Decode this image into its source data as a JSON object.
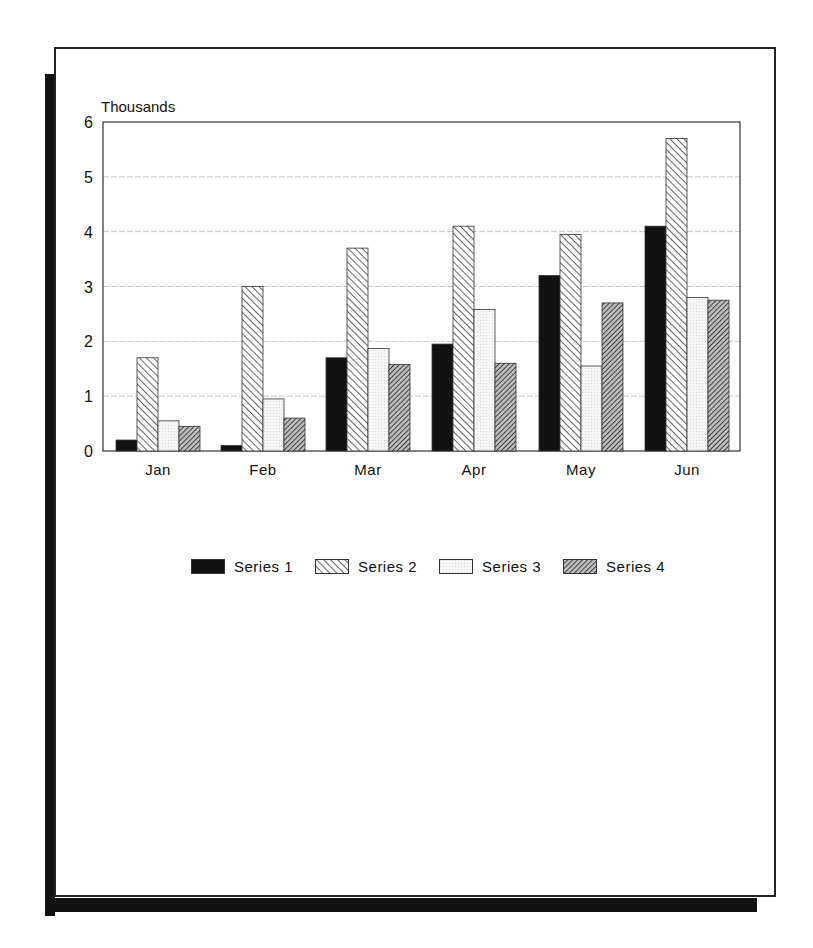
{
  "chart_data": {
    "type": "bar",
    "title": "",
    "ylabel": "Thousands",
    "xlabel": "",
    "ylim": [
      0,
      6
    ],
    "yticks": [
      0,
      1,
      2,
      3,
      4,
      5,
      6
    ],
    "grid": true,
    "legend_position": "bottom",
    "categories": [
      "Jan",
      "Feb",
      "Mar",
      "Apr",
      "May",
      "Jun"
    ],
    "series": [
      {
        "name": "Series 1",
        "pattern": "solid-black",
        "values": [
          0.2,
          0.1,
          1.7,
          1.95,
          3.2,
          4.1
        ]
      },
      {
        "name": "Series 2",
        "pattern": "diagonal-hatch-light",
        "values": [
          1.7,
          3.0,
          3.7,
          4.1,
          3.95,
          5.7
        ]
      },
      {
        "name": "Series 3",
        "pattern": "light-dots",
        "values": [
          0.55,
          0.95,
          1.87,
          2.58,
          1.55,
          2.8
        ]
      },
      {
        "name": "Series 4",
        "pattern": "diagonal-hatch-dense",
        "values": [
          0.45,
          0.6,
          1.58,
          1.6,
          2.7,
          2.75
        ]
      }
    ]
  },
  "legend": {
    "items": [
      {
        "label": "Series 1"
      },
      {
        "label": "Series 2"
      },
      {
        "label": "Series 3"
      },
      {
        "label": "Series 4"
      }
    ]
  },
  "colors": {
    "ink": "#111111",
    "gridline": "#c8c8c8",
    "paper": "#ffffff"
  }
}
